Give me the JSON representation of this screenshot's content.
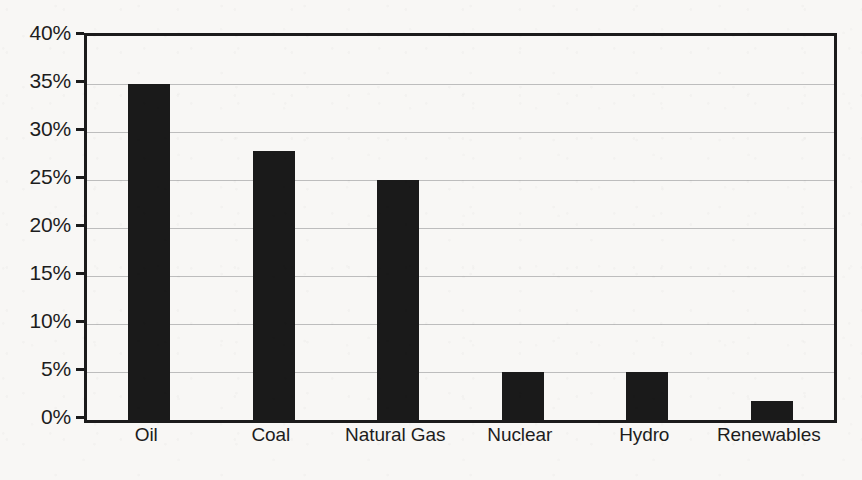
{
  "chart_data": {
    "type": "bar",
    "title": "",
    "subtitle": "",
    "xlabel": "",
    "ylabel": "",
    "categories": [
      "Oil",
      "Coal",
      "Natural Gas",
      "Nuclear",
      "Hydro",
      "Renewables"
    ],
    "values": [
      35,
      28,
      25,
      5,
      5,
      2
    ],
    "value_unit": "%",
    "ylim": [
      0,
      40
    ],
    "ytick_step": 5,
    "ytick_labels": [
      "40%",
      "35%",
      "30%",
      "25%",
      "20%",
      "15%",
      "10%",
      "5%",
      "0%"
    ],
    "ytick_values": [
      40,
      35,
      30,
      25,
      20,
      15,
      10,
      5,
      0
    ],
    "grid": true,
    "grid_axis": "y",
    "legend": false,
    "legend_position": "none",
    "annotations": [],
    "colors": {
      "bar": "#1a1a1a",
      "axis": "#1b1b1b",
      "gridline": "#bdbdbd",
      "background": "#f8f7f5",
      "text": "#1d1d1d"
    }
  }
}
